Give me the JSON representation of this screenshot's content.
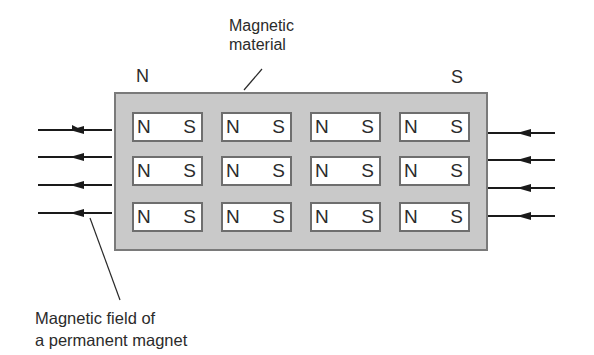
{
  "diagram": {
    "title_label": {
      "line1": "Magnetic",
      "line2": "material"
    },
    "pole_left": "N",
    "pole_right": "S",
    "field_label": {
      "line1": "Magnetic field of",
      "line2": "a permanent magnet"
    },
    "domains": {
      "rows": 3,
      "cols": 4,
      "north_label": "N",
      "south_label": "S"
    },
    "arrows": {
      "left_count": 4,
      "right_count": 4,
      "direction": "right-to-left"
    },
    "colors": {
      "material_fill": "#c9c9c9",
      "material_border": "#7a7a7a",
      "domain_fill": "#ffffff",
      "line": "#1a1a1a"
    }
  },
  "cells": [
    {
      "n": "N",
      "s": "S"
    },
    {
      "n": "N",
      "s": "S"
    },
    {
      "n": "N",
      "s": "S"
    },
    {
      "n": "N",
      "s": "S"
    },
    {
      "n": "N",
      "s": "S"
    },
    {
      "n": "N",
      "s": "S"
    },
    {
      "n": "N",
      "s": "S"
    },
    {
      "n": "N",
      "s": "S"
    },
    {
      "n": "N",
      "s": "S"
    },
    {
      "n": "N",
      "s": "S"
    },
    {
      "n": "N",
      "s": "S"
    },
    {
      "n": "N",
      "s": "S"
    }
  ]
}
